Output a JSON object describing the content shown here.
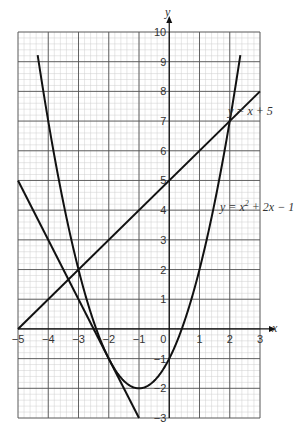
{
  "chart_data": {
    "type": "line",
    "title": "",
    "xlabel": "x",
    "ylabel": "y",
    "xlim": [
      -5,
      3
    ],
    "ylim": [
      -3,
      10
    ],
    "grid": true,
    "x_ticks": [
      "−5",
      "−4",
      "−3",
      "−2",
      "−1",
      "0",
      "1",
      "2",
      "3"
    ],
    "y_ticks": [
      "10",
      "9",
      "8",
      "7",
      "6",
      "5",
      "4",
      "3",
      "2",
      "1",
      "−1",
      "−2",
      "−3"
    ],
    "series": [
      {
        "name": "y = x² + 2x − 1",
        "type": "curve",
        "x": [
          -4.317,
          -4,
          -3,
          -2,
          -1,
          0,
          1,
          2,
          2.317
        ],
        "y": [
          10,
          7,
          2,
          -1,
          -2,
          -1,
          2,
          7,
          10
        ]
      },
      {
        "name": "y = x + 5",
        "type": "line",
        "x": [
          -5,
          3
        ],
        "y": [
          0,
          8
        ]
      },
      {
        "name": "y = −2x − 5",
        "type": "line",
        "x": [
          -5,
          -1
        ],
        "y": [
          5,
          -3
        ]
      }
    ],
    "annotations": [
      "y = x + 5",
      "y = x² + 2x − 1"
    ]
  },
  "labels": {
    "x_axis": "x",
    "y_axis": "y",
    "line_label": "y = x + 5",
    "curve_label_pre": "y = x",
    "curve_label_sup": "2",
    "curve_label_post": " + 2x − 1"
  }
}
